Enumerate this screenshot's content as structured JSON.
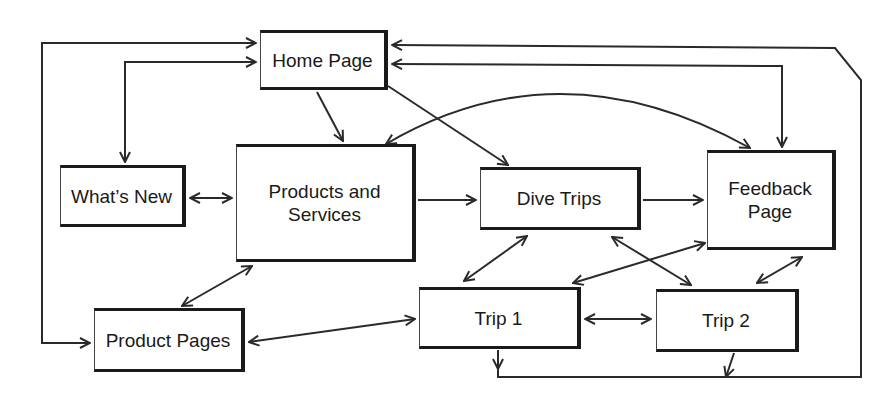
{
  "diagram": {
    "type": "site-navigation-map",
    "nodes": {
      "home": {
        "label": "Home Page"
      },
      "whats_new": {
        "label": "What’s New"
      },
      "products_services": {
        "label_line1": "Products and",
        "label_line2": "Services"
      },
      "dive_trips": {
        "label": "Dive Trips"
      },
      "feedback": {
        "label_line1": "Feedback",
        "label_line2": "Page"
      },
      "product_pages": {
        "label": "Product Pages"
      },
      "trip1": {
        "label": "Trip 1"
      },
      "trip2": {
        "label": "Trip 2"
      }
    },
    "edges": [
      {
        "from": "Product Pages",
        "to": "Home Page",
        "type": "one-way",
        "route": "left outer loop"
      },
      {
        "from": "Home Page",
        "to": "What’s New",
        "type": "two-way"
      },
      {
        "from": "Home Page",
        "to": "Products and Services",
        "type": "one-way"
      },
      {
        "from": "Home Page",
        "to": "Dive Trips",
        "type": "one-way"
      },
      {
        "from": "Home Page",
        "to": "Feedback Page",
        "type": "two-way"
      },
      {
        "from": "Products and Services",
        "to": "Feedback Page",
        "type": "two-way",
        "route": "curved"
      },
      {
        "from": "What’s New",
        "to": "Products and Services",
        "type": "two-way"
      },
      {
        "from": "Products and Services",
        "to": "Dive Trips",
        "type": "one-way"
      },
      {
        "from": "Dive Trips",
        "to": "Feedback Page",
        "type": "one-way"
      },
      {
        "from": "Products and Services",
        "to": "Product Pages",
        "type": "two-way"
      },
      {
        "from": "Product Pages",
        "to": "Trip 1",
        "type": "two-way"
      },
      {
        "from": "Dive Trips",
        "to": "Trip 1",
        "type": "two-way"
      },
      {
        "from": "Dive Trips",
        "to": "Trip 2",
        "type": "two-way"
      },
      {
        "from": "Feedback Page",
        "to": "Trip 1",
        "type": "two-way"
      },
      {
        "from": "Feedback Page",
        "to": "Trip 2",
        "type": "two-way"
      },
      {
        "from": "Trip 1",
        "to": "Trip 2",
        "type": "two-way"
      },
      {
        "from": "Trip 1 / Trip 2",
        "to": "Home Page",
        "type": "one-way",
        "route": "bottom-right outer loop"
      }
    ],
    "colors": {
      "line": "#2a2a2a",
      "background": "#ffffff"
    }
  }
}
